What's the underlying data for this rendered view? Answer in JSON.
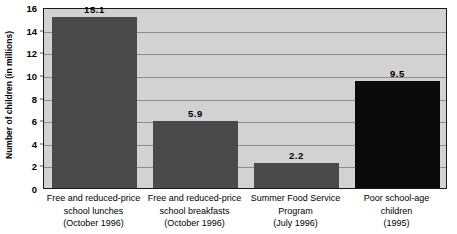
{
  "chart_data": {
    "type": "bar",
    "title": "",
    "subtitle": "",
    "xlabel": "",
    "ylabel": "Number of children (in millions)",
    "ylim": [
      0,
      16
    ],
    "ytick_values": [
      16,
      14,
      12,
      10,
      8,
      6,
      4,
      2,
      0
    ],
    "ytick_labels": [
      "16",
      "14",
      "12",
      "10",
      "8",
      "6",
      "4",
      "2",
      "0"
    ],
    "grid": true,
    "legend": null,
    "categories": [
      "Free and reduced-price school lunches (October 1996)",
      "Free and reduced-price school breakfasts (October 1996)",
      "Summer Food Service Program (July 1996)",
      "Poor school-age children (1995)"
    ],
    "category_lines": [
      [
        "Free and reduced-price",
        "school lunches",
        "(October 1996)"
      ],
      [
        "Free and reduced-price",
        "school breakfasts",
        "(October 1996)"
      ],
      [
        "Summer Food Service",
        "Program",
        "(July 1996)"
      ],
      [
        "Poor school-age",
        "children",
        "(1995)"
      ]
    ],
    "values": [
      15.1,
      5.9,
      2.2,
      9.5
    ],
    "value_labels": [
      "15.1",
      "5.9",
      "2.2",
      "9.5"
    ],
    "bar_colors": [
      "#4a4a4a",
      "#4a4a4a",
      "#4a4a4a",
      "#0a0a0a"
    ],
    "plot_background": "#d2d2d2",
    "gridline_color": "#8d8d8d",
    "axis_color": "#1a1a1a"
  }
}
